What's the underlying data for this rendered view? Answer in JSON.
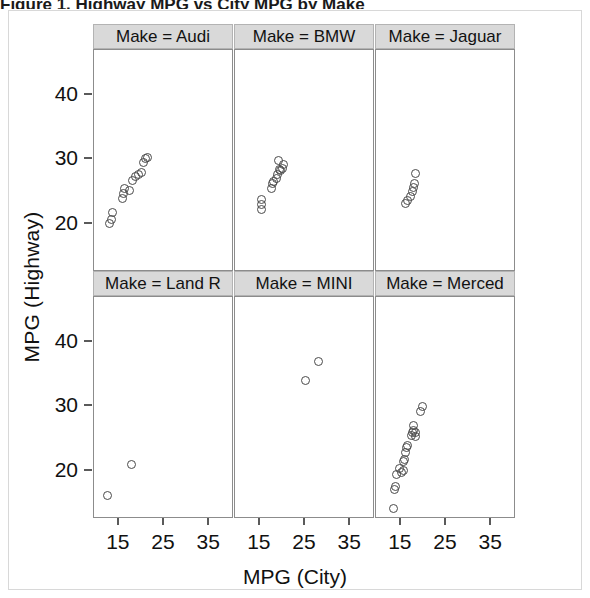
{
  "figure": {
    "cropped_caption_sliver": "Figure 1.  Highway MPG vs City MPG by Make",
    "x_axis_title": "MPG (City)",
    "y_axis_title": "MPG (Highway)"
  },
  "axes": {
    "x_ticks": [
      15,
      25,
      35
    ],
    "y_ticks": [
      20,
      30,
      40
    ],
    "x_tick_labels": [
      "15",
      "25",
      "35"
    ],
    "y_tick_labels": [
      "20",
      "30",
      "40"
    ],
    "xlim": [
      9.5,
      40.5
    ],
    "ylim": [
      12.5,
      47.0
    ]
  },
  "colors": {
    "strip_background": "#d9d9d9",
    "strip_border": "#b3b3b3",
    "panel_border": "#8c8c8c",
    "marker_stroke": "#4a4a4a",
    "panel_background": "#ffffff",
    "text": "#111111"
  },
  "strip_labels": [
    "Make = Audi",
    "Make = BMW",
    "Make = Jaguar",
    "Make = Land R",
    "Make = MINI",
    "Make = Merced"
  ],
  "chart_data": {
    "type": "scatter",
    "title": "",
    "xlabel": "MPG (City)",
    "ylabel": "MPG (Highway)",
    "xlim": [
      9.5,
      40.5
    ],
    "ylim": [
      12.5,
      47.0
    ],
    "grid": false,
    "legend": "none",
    "facet_variable": "Make",
    "facet_layout": {
      "rows": 2,
      "cols": 3
    },
    "marker": {
      "shape": "open-circle",
      "color": "#4a4a4a",
      "size": 9
    },
    "panels": [
      {
        "label": "Make = Audi",
        "row": 0,
        "col": 0,
        "points": [
          {
            "x": 13.0,
            "y": 20.0
          },
          {
            "x": 13.4,
            "y": 20.6
          },
          {
            "x": 13.6,
            "y": 21.7
          },
          {
            "x": 15.8,
            "y": 24.0
          },
          {
            "x": 16.1,
            "y": 24.7
          },
          {
            "x": 16.3,
            "y": 25.4
          },
          {
            "x": 17.4,
            "y": 25.1
          },
          {
            "x": 18.0,
            "y": 26.7
          },
          {
            "x": 18.6,
            "y": 27.4
          },
          {
            "x": 19.3,
            "y": 27.7
          },
          {
            "x": 20.0,
            "y": 27.9
          },
          {
            "x": 20.4,
            "y": 29.5
          },
          {
            "x": 21.0,
            "y": 30.1
          },
          {
            "x": 21.3,
            "y": 30.3
          }
        ]
      },
      {
        "label": "Make = BMW",
        "row": 0,
        "col": 1,
        "points": [
          {
            "x": 15.3,
            "y": 22.2
          },
          {
            "x": 15.3,
            "y": 23.0
          },
          {
            "x": 15.4,
            "y": 23.8
          },
          {
            "x": 17.5,
            "y": 25.4
          },
          {
            "x": 17.8,
            "y": 26.2
          },
          {
            "x": 18.1,
            "y": 26.5
          },
          {
            "x": 18.6,
            "y": 27.0
          },
          {
            "x": 18.9,
            "y": 27.7
          },
          {
            "x": 19.3,
            "y": 28.5
          },
          {
            "x": 19.6,
            "y": 28.3
          },
          {
            "x": 20.0,
            "y": 28.6
          },
          {
            "x": 19.2,
            "y": 29.8
          },
          {
            "x": 20.2,
            "y": 29.2
          }
        ]
      },
      {
        "label": "Make = Jaguar",
        "row": 0,
        "col": 2,
        "points": [
          {
            "x": 16.0,
            "y": 23.2
          },
          {
            "x": 16.5,
            "y": 23.6
          },
          {
            "x": 17.1,
            "y": 24.2
          },
          {
            "x": 17.6,
            "y": 25.0
          },
          {
            "x": 17.8,
            "y": 25.7
          },
          {
            "x": 18.0,
            "y": 26.3
          },
          {
            "x": 18.2,
            "y": 27.8
          }
        ]
      },
      {
        "label": "Make = Land R",
        "row": 1,
        "col": 0,
        "points": [
          {
            "x": 12.4,
            "y": 16.2
          },
          {
            "x": 17.7,
            "y": 21.0
          }
        ]
      },
      {
        "label": "Make = MINI",
        "row": 1,
        "col": 1,
        "points": [
          {
            "x": 25.0,
            "y": 34.0
          },
          {
            "x": 28.0,
            "y": 37.0
          }
        ]
      },
      {
        "label": "Make = Merced",
        "row": 1,
        "col": 2,
        "points": [
          {
            "x": 13.3,
            "y": 14.1
          },
          {
            "x": 13.6,
            "y": 17.1
          },
          {
            "x": 13.9,
            "y": 17.6
          },
          {
            "x": 14.0,
            "y": 19.4
          },
          {
            "x": 14.6,
            "y": 20.3
          },
          {
            "x": 15.2,
            "y": 19.8
          },
          {
            "x": 15.5,
            "y": 20.1
          },
          {
            "x": 15.6,
            "y": 21.4
          },
          {
            "x": 15.8,
            "y": 21.8
          },
          {
            "x": 16.0,
            "y": 22.9
          },
          {
            "x": 16.2,
            "y": 23.6
          },
          {
            "x": 16.4,
            "y": 24.0
          },
          {
            "x": 17.3,
            "y": 25.5
          },
          {
            "x": 17.6,
            "y": 26.0
          },
          {
            "x": 17.9,
            "y": 26.3
          },
          {
            "x": 18.2,
            "y": 26.0
          },
          {
            "x": 18.3,
            "y": 25.3
          },
          {
            "x": 17.9,
            "y": 27.1
          },
          {
            "x": 19.3,
            "y": 29.2
          },
          {
            "x": 19.7,
            "y": 30.0
          }
        ]
      }
    ]
  }
}
